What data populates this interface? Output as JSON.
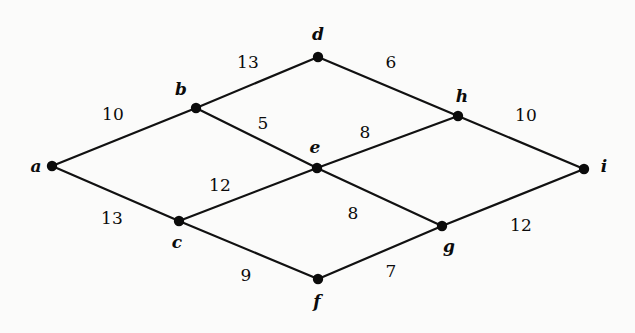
{
  "figure": {
    "background_color": "#fbfbfa",
    "ink_color": "#0b0b0b",
    "width": 635,
    "height": 333
  },
  "chart_data": {
    "type": "diagram",
    "subtype": "undirected-weighted-graph",
    "title": "",
    "xlabel": "",
    "ylabel": "",
    "grid": false,
    "legend": "none",
    "directed": false,
    "weighted": true,
    "nodes": [
      {
        "id": "a",
        "label": "a",
        "x": 52,
        "y": 166,
        "label_x": 36,
        "label_y": 166
      },
      {
        "id": "b",
        "label": "b",
        "x": 196,
        "y": 108,
        "label_x": 181,
        "label_y": 89
      },
      {
        "id": "c",
        "label": "c",
        "x": 179,
        "y": 221,
        "label_x": 177,
        "label_y": 242
      },
      {
        "id": "d",
        "label": "d",
        "x": 318,
        "y": 57,
        "label_x": 318,
        "label_y": 34
      },
      {
        "id": "e",
        "label": "e",
        "x": 317,
        "y": 168,
        "label_x": 315,
        "label_y": 147
      },
      {
        "id": "f",
        "label": "f",
        "x": 318,
        "y": 279,
        "label_x": 317,
        "label_y": 301
      },
      {
        "id": "g",
        "label": "g",
        "x": 442,
        "y": 226,
        "label_x": 449,
        "label_y": 246
      },
      {
        "id": "h",
        "label": "h",
        "x": 458,
        "y": 116,
        "label_x": 462,
        "label_y": 96
      },
      {
        "id": "i",
        "label": "i",
        "x": 584,
        "y": 169,
        "label_x": 604,
        "label_y": 166
      }
    ],
    "edges": [
      {
        "source": "a",
        "target": "b",
        "weight": 10,
        "weight_x": 113,
        "weight_y": 114
      },
      {
        "source": "a",
        "target": "c",
        "weight": 13,
        "weight_x": 112,
        "weight_y": 218
      },
      {
        "source": "b",
        "target": "d",
        "weight": 13,
        "weight_x": 248,
        "weight_y": 62
      },
      {
        "source": "b",
        "target": "e",
        "weight": 5,
        "weight_x": 263,
        "weight_y": 123
      },
      {
        "source": "c",
        "target": "e",
        "weight": 12,
        "weight_x": 220,
        "weight_y": 185
      },
      {
        "source": "c",
        "target": "f",
        "weight": 9,
        "weight_x": 246,
        "weight_y": 275
      },
      {
        "source": "d",
        "target": "h",
        "weight": 6,
        "weight_x": 391,
        "weight_y": 62
      },
      {
        "source": "e",
        "target": "h",
        "weight": 8,
        "weight_x": 365,
        "weight_y": 132
      },
      {
        "source": "e",
        "target": "g",
        "weight": 8,
        "weight_x": 353,
        "weight_y": 213
      },
      {
        "source": "f",
        "target": "g",
        "weight": 7,
        "weight_x": 391,
        "weight_y": 271
      },
      {
        "source": "g",
        "target": "i",
        "weight": 12,
        "weight_x": 521,
        "weight_y": 225
      },
      {
        "source": "h",
        "target": "i",
        "weight": 10,
        "weight_x": 526,
        "weight_y": 115
      }
    ]
  }
}
